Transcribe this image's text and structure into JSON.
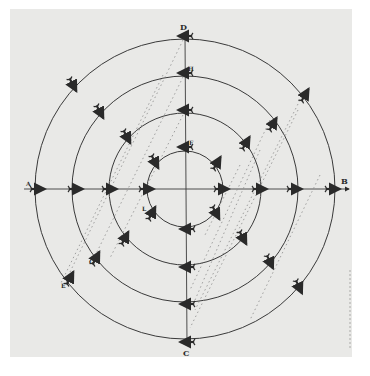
{
  "figure": {
    "type": "concentric-circles-vector-diagram",
    "center": {
      "x": 185,
      "y": 189
    },
    "ring_radii": [
      38,
      76,
      113,
      150
    ],
    "labels": {
      "top": "D",
      "upper_inner_axis": "H",
      "inner_top": "F",
      "left": "A",
      "right": "B",
      "bottom": "C",
      "inner_lower_left": "L",
      "second_lower_left": "G",
      "outer_lower_left": "E"
    },
    "colors": {
      "paper": "#e9e9e7",
      "ink": "#2a2a2a",
      "dotted": "#8a8a8a"
    }
  }
}
